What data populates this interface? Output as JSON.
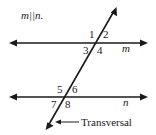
{
  "diagram": {
    "given_label": "m||n.",
    "lines": [
      {
        "id": "m",
        "label": "m",
        "type": "parallel"
      },
      {
        "id": "n",
        "label": "n",
        "type": "parallel"
      },
      {
        "id": "transversal",
        "label": "Transversal",
        "type": "transversal"
      }
    ],
    "angles": {
      "upper_intersection": [
        "1",
        "2",
        "3",
        "4"
      ],
      "lower_intersection": [
        "5",
        "6",
        "7",
        "8"
      ]
    },
    "callout": {
      "text": "Transversal",
      "arrow": "left-arrow"
    },
    "colors": {
      "ink": "#1a1a1a",
      "background": "#ffffff"
    }
  }
}
